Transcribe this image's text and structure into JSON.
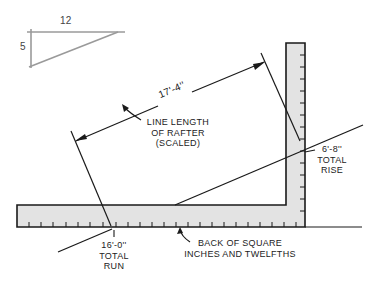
{
  "inset_triangle": {
    "run_label": "12",
    "rise_label": "5",
    "color": "#9a9a9a"
  },
  "rafter_dimension": "17'-4''",
  "rafter_note": {
    "line1": "LINE LENGTH",
    "line2": "OF RAFTER",
    "line3": "(SCALED)"
  },
  "rise_note": {
    "value": "6'-8''",
    "line2": "TOTAL",
    "line3": "RISE"
  },
  "run_note": {
    "value": "16'-0''",
    "line2": "TOTAL",
    "line3": "RUN"
  },
  "square_note": {
    "line1": "BACK OF SQUARE",
    "line2": "INCHES AND TWELFTHS"
  },
  "colors": {
    "square_fill": "#e3e3e3",
    "stroke": "#1a1a1a"
  }
}
